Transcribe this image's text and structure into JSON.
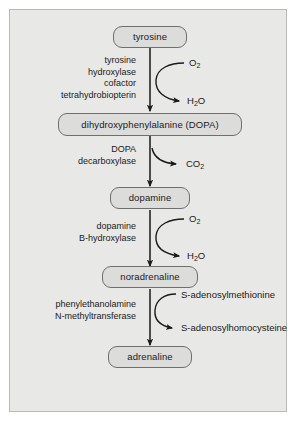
{
  "diagram": {
    "background_color": "#e8e8e6",
    "node_fill": "#dcdcda",
    "node_stroke": "#6e6e6c",
    "arrow_color": "#1a1a1a",
    "nodes": [
      {
        "id": "tyrosine",
        "label": "tyrosine"
      },
      {
        "id": "dopa",
        "label": "dihydroxyphenylalanine (DOPA)"
      },
      {
        "id": "dopamine",
        "label": "dopamine"
      },
      {
        "id": "noradrenaline",
        "label": "noradrenaline"
      },
      {
        "id": "adrenaline",
        "label": "adrenaline"
      }
    ],
    "steps": [
      {
        "id": "step-1",
        "from": "tyrosine",
        "to": "dopa",
        "enzyme_lines": [
          "tyrosine",
          "hydroxylase",
          "cofactor",
          "tetrahydrobiopterin"
        ],
        "substrate_in": "O2",
        "substrate_in_html": "O<sub>2</sub>",
        "substrate_out": "H2O",
        "substrate_out_html": "H<sub>2</sub>O"
      },
      {
        "id": "step-2",
        "from": "dopa",
        "to": "dopamine",
        "enzyme_lines": [
          "DOPA",
          "decarboxylase"
        ],
        "substrate_in": null,
        "substrate_out": "CO2",
        "substrate_out_html": "CO<sub>2</sub>"
      },
      {
        "id": "step-3",
        "from": "dopamine",
        "to": "noradrenaline",
        "enzyme_lines": [
          "dopamine",
          "B-hydroxylase"
        ],
        "substrate_in": "O2",
        "substrate_in_html": "O<sub>2</sub>",
        "substrate_out": "H2O",
        "substrate_out_html": "H<sub>2</sub>O"
      },
      {
        "id": "step-4",
        "from": "noradrenaline",
        "to": "adrenaline",
        "enzyme_lines": [
          "phenylethanolamine",
          "N-methyltransferase"
        ],
        "substrate_in": "S-adenosylmethionine",
        "substrate_out": "S-adenosylhomocysteine"
      }
    ]
  }
}
